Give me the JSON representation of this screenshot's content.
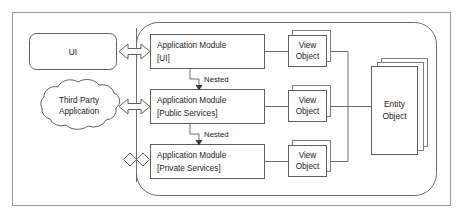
{
  "diagram": {
    "type": "architecture-block-diagram",
    "colors": {
      "background": "#ffffff",
      "stroke": "#5f5f5f",
      "frame_stroke": "#9a9a9a",
      "connector": "#6e6e6e",
      "text": "#1c1c1c",
      "arrowhead_fill": "#3a3a3a"
    },
    "external_actors": [
      {
        "id": "ui-client",
        "shape": "rounded-rectangle",
        "label": "UI"
      },
      {
        "id": "third-party-application",
        "shape": "cloud",
        "label_line1": "Third Party",
        "label_line2": "Application"
      }
    ],
    "modules": [
      {
        "id": "application-module-ui",
        "title": "Application Module",
        "qualifier": "[UI]",
        "access": "permitted"
      },
      {
        "id": "application-module-public-services",
        "title": "Application Module",
        "qualifier": "[Public Services]",
        "access": "permitted"
      },
      {
        "id": "application-module-private-services",
        "title": "Application Module",
        "qualifier": "[Private Services]",
        "access": "blocked"
      }
    ],
    "view_objects": [
      {
        "id": "view-object-ui",
        "line1": "View",
        "line2": "Object"
      },
      {
        "id": "view-object-public",
        "line1": "View",
        "line2": "Object"
      },
      {
        "id": "view-object-private",
        "line1": "View",
        "line2": "Object"
      }
    ],
    "entity_object": {
      "id": "entity-object",
      "line1": "Entity",
      "line2": "Object",
      "stack_layers": 3
    },
    "nested_relations": [
      {
        "id": "nested-ui-to-public",
        "label": "Nested"
      },
      {
        "id": "nested-public-to-private",
        "label": "Nested"
      }
    ],
    "connectors": {
      "bidirectional_arrow_label": "",
      "blocked_marker": "x-cross"
    }
  }
}
